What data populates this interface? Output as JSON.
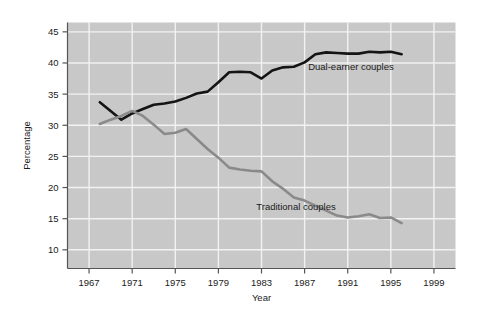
{
  "figure": {
    "background_color": "#ffffff",
    "plot_background_color": "#c8c8c8",
    "gridline_color": "#f2f2f2",
    "axis_color": "#555555"
  },
  "chart_data": {
    "type": "line",
    "title": "",
    "subtitle": "",
    "xlabel": "Year",
    "ylabel": "Percentage",
    "xlim": [
      1965,
      2001
    ],
    "ylim": [
      7,
      46.5
    ],
    "xticks": [
      1967,
      1971,
      1975,
      1979,
      1983,
      1987,
      1991,
      1995,
      1999
    ],
    "xticklabels": [
      "1967",
      "1971",
      "1975",
      "1979",
      "1983",
      "1987",
      "1991",
      "1995",
      "1999"
    ],
    "yticks": [
      10,
      15,
      20,
      25,
      30,
      35,
      40,
      45
    ],
    "yticklabels": [
      "10",
      "15",
      "20",
      "25",
      "30",
      "35",
      "40",
      "45"
    ],
    "grid": true,
    "grid_axis": "both",
    "legend": "inline-annotations",
    "series": [
      {
        "name": "Dual-earner couples",
        "color": "#141414",
        "line_width": 2.6,
        "label_position": {
          "x": 1991.3,
          "y": 38.9
        },
        "x": [
          1968,
          1969,
          1970,
          1971,
          1972,
          1973,
          1974,
          1975,
          1976,
          1977,
          1978,
          1979,
          1980,
          1981,
          1982,
          1983,
          1984,
          1985,
          1986,
          1987,
          1988,
          1989,
          1990,
          1991,
          1992,
          1993,
          1994,
          1995,
          1996
        ],
        "values": [
          33.7,
          32.3,
          30.9,
          31.9,
          32.6,
          33.3,
          33.5,
          33.8,
          34.4,
          35.1,
          35.4,
          36.9,
          38.5,
          38.6,
          38.5,
          37.5,
          38.8,
          39.3,
          39.4,
          40.1,
          41.4,
          41.7,
          41.6,
          41.5,
          41.5,
          41.8,
          41.7,
          41.8,
          41.4
        ]
      },
      {
        "name": "Traditional couples",
        "color": "#8a8a8a",
        "line_width": 2.6,
        "label_position": {
          "x": 1986.2,
          "y": 16.4
        },
        "x": [
          1968,
          1969,
          1970,
          1971,
          1972,
          1973,
          1974,
          1975,
          1976,
          1977,
          1978,
          1979,
          1980,
          1981,
          1982,
          1983,
          1984,
          1985,
          1986,
          1987,
          1988,
          1989,
          1990,
          1991,
          1992,
          1993,
          1994,
          1995,
          1996
        ],
        "values": [
          30.2,
          30.9,
          31.5,
          32.3,
          31.5,
          30.1,
          28.6,
          28.8,
          29.4,
          27.8,
          26.2,
          24.8,
          23.2,
          22.9,
          22.7,
          22.6,
          21.0,
          19.8,
          18.4,
          17.9,
          17.1,
          16.3,
          15.5,
          15.2,
          15.4,
          15.7,
          15.1,
          15.2,
          14.3
        ]
      }
    ]
  }
}
